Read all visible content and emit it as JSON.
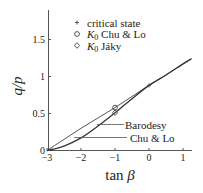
{
  "chart_data": {
    "type": "line",
    "title": "",
    "xlabel": "tan β",
    "ylabel": "q/p",
    "xlim": [
      -3,
      1.25
    ],
    "ylim": [
      0,
      1.9
    ],
    "x_ticks": [
      -3,
      -2,
      -1,
      0,
      1
    ],
    "x_tick_labels": [
      "−3",
      "−2",
      "−1",
      "0",
      "1"
    ],
    "y_ticks": [
      0,
      0.5,
      1,
      1.5
    ],
    "y_tick_labels": [
      "0",
      "0.5",
      "1",
      "1.5"
    ],
    "grid": false,
    "legend_position": "upper center",
    "legend": [
      {
        "marker": "+",
        "label_prefix": "",
        "label": "critical state"
      },
      {
        "marker": "circle",
        "label_prefix": "K",
        "label_sub": "0",
        "label": " Chu & Lo"
      },
      {
        "marker": "diamond",
        "label_prefix": "K",
        "label_sub": "0",
        "label": " Jáky"
      }
    ],
    "series": [
      {
        "name": "Barodesy",
        "x": [
          -3,
          -2.5,
          -2,
          -1.5,
          -1,
          -0.5,
          0,
          0.5,
          1,
          1.25
        ],
        "y": [
          0,
          0.15,
          0.3,
          0.44,
          0.58,
          0.73,
          0.88,
          1.02,
          1.17,
          1.24
        ]
      },
      {
        "name": "Chu & Lo",
        "x": [
          -3,
          -2.5,
          -2,
          -1.5,
          -1,
          -0.5,
          0,
          0.5,
          1,
          1.25
        ],
        "y": [
          0,
          0.06,
          0.17,
          0.33,
          0.51,
          0.7,
          0.88,
          1.02,
          1.17,
          1.24
        ]
      }
    ],
    "points": [
      {
        "name": "critical state",
        "marker": "+",
        "x": 0,
        "y": 0.88
      },
      {
        "name": "K0 Chu & Lo",
        "marker": "circle",
        "x": -1,
        "y": 0.58
      },
      {
        "name": "K0 Jáky",
        "marker": "diamond",
        "x": -1,
        "y": 0.51
      }
    ],
    "annotations": [
      {
        "text": "Barodesy",
        "target_series": "Barodesy"
      },
      {
        "text": "Chu & Lo",
        "target_series": "Chu & Lo"
      }
    ]
  }
}
